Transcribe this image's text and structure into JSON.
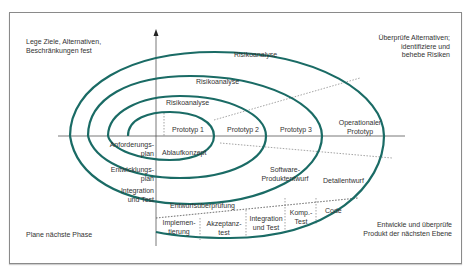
{
  "colors": {
    "spiral": "#1a6b65",
    "axis": "#555555",
    "dotted": "#666666",
    "text": "#333333",
    "frame": "#8a8a8a"
  },
  "quadrants": {
    "top_left": [
      "Lege Ziele, Alternativen,",
      "Beschränkungen fest"
    ],
    "top_right": [
      "Überprüfe Alternativen;",
      "identifiziere und",
      "behebe Risiken"
    ],
    "bottom_left": [
      "Plane nächste Phase"
    ],
    "bottom_right": [
      "Entwickle und überprüfe",
      "Produkt der nächsten Ebene"
    ]
  },
  "risk_analysis": {
    "r1": "Risikoanalyse",
    "r2": "Risikoanalyse",
    "r3": "Risikoanalyse"
  },
  "prototypes": {
    "p1": "Prototyp 1",
    "p2": "Prototyp 2",
    "p3": "Prototyp 3",
    "p4": [
      "Operationaler",
      "Prototyp"
    ]
  },
  "planning": {
    "requirements_plan": [
      "Anforderungs-",
      "plan"
    ],
    "development_plan": [
      "Entwicklungs-",
      "plan"
    ],
    "integration_test_plan": [
      "Integration",
      "und Test"
    ]
  },
  "development": {
    "concept": "Ablaufkonzept",
    "software_design": [
      "Software-",
      "Produktentwurf"
    ],
    "detail_design": "Detailentwurf",
    "design_review": "Entwurfsüberprüfung",
    "code": "Code",
    "unit_test": [
      "Komp.-",
      "Test"
    ],
    "integration_test": [
      "Integration",
      "und Test"
    ],
    "acceptance_test": [
      "Akzeptanz-",
      "test"
    ],
    "implementation": [
      "Implemen-",
      "tierung"
    ]
  }
}
